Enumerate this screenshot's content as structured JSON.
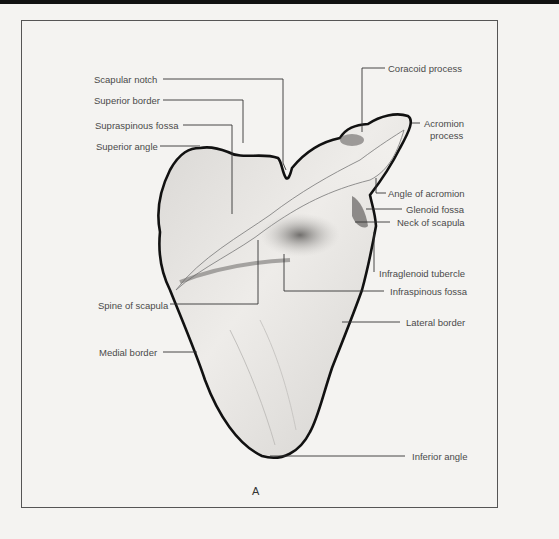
{
  "figure": {
    "panel_letter": "A"
  },
  "labels": {
    "left": [
      {
        "id": "scapular_notch",
        "text": "Scapular notch"
      },
      {
        "id": "superior_border",
        "text": "Superior border"
      },
      {
        "id": "supraspinous_fossa",
        "text": "Supraspinous fossa"
      },
      {
        "id": "superior_angle",
        "text": "Superior angle"
      },
      {
        "id": "spine_of_scapula",
        "text": "Spine of scapula"
      },
      {
        "id": "medial_border",
        "text": "Medial border"
      }
    ],
    "right": [
      {
        "id": "coracoid_process",
        "text": "Coracoid process"
      },
      {
        "id": "acromion_process_1",
        "text": "Acromion"
      },
      {
        "id": "acromion_process_2",
        "text": "process"
      },
      {
        "id": "angle_of_acromion",
        "text": "Angle of acromion"
      },
      {
        "id": "glenoid_fossa",
        "text": "Glenoid fossa"
      },
      {
        "id": "neck_of_scapula",
        "text": "Neck of scapula"
      },
      {
        "id": "infraglenoid_tubercle",
        "text": "Infraglenoid tubercle"
      },
      {
        "id": "infraspinous_fossa",
        "text": "Infraspinous fossa"
      },
      {
        "id": "lateral_border",
        "text": "Lateral border"
      },
      {
        "id": "inferior_angle",
        "text": "Inferior angle"
      }
    ]
  },
  "colors": {
    "outline": "#111111",
    "leader": "#333333",
    "bone_light": "#e6e4e1",
    "bone_shadow": "#9a9896",
    "paper": "#f4f3f1"
  }
}
